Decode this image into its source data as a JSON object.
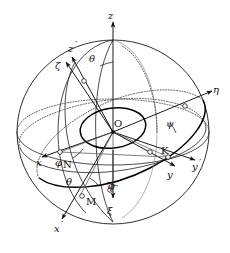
{
  "figure": {
    "background_color": "#ffffff",
    "stroke_color": "#1a1a1a",
    "width": 230,
    "height": 253
  },
  "axes": {
    "fixed": [
      {
        "id": "z",
        "label": "z",
        "primed": false,
        "description": "fixed vertical axis, arrow up"
      },
      {
        "id": "x",
        "label": "x",
        "primed": false,
        "description": "fixed axis toward lower-left"
      },
      {
        "id": "y",
        "label": "y",
        "primed": false,
        "description": "fixed axis toward lower-right"
      }
    ],
    "intermediate": [
      {
        "id": "zp",
        "label": "z",
        "prime": "′",
        "description": "intermediate axis toward upper-left"
      },
      {
        "id": "xp",
        "label": "x",
        "prime": "′",
        "description": "intermediate axis toward lower-left bottom"
      },
      {
        "id": "yp",
        "label": "y",
        "prime": "′",
        "description": "intermediate axis toward right"
      }
    ],
    "body": [
      {
        "id": "zeta",
        "label": "ζ",
        "description": "body axis zeta, upper-left"
      },
      {
        "id": "xi",
        "label": "ξ",
        "description": "body axis xi, downward"
      },
      {
        "id": "eta",
        "label": "η",
        "description": "body axis eta, upper-right"
      }
    ]
  },
  "angles": [
    {
      "id": "theta-top",
      "label": "θ",
      "description": "nutation angle between z and zeta at top"
    },
    {
      "id": "theta-bottom",
      "label": "θ",
      "description": "nutation angle near node N at bottom"
    },
    {
      "id": "phi",
      "label": "φ",
      "description": "precession angle at node N"
    },
    {
      "id": "phi-bottom",
      "label": "ϕ",
      "description": "angle at bottom near M"
    },
    {
      "id": "psi",
      "label": "ψ",
      "description": "spin angle at right, near K"
    }
  ],
  "points": [
    {
      "id": "O",
      "label": "O",
      "description": "origin / sphere center"
    },
    {
      "id": "N",
      "label": "N",
      "description": "node point, lower left"
    },
    {
      "id": "K",
      "label": "K",
      "description": "node point, right"
    },
    {
      "id": "M",
      "label": "M",
      "description": "node point, bottom"
    }
  ],
  "labels": {
    "z": "z",
    "z_prime": "z",
    "x": "x",
    "x_prime": "x",
    "y": "y",
    "y_prime": "y",
    "prime_mark": "′",
    "zeta": "ζ",
    "xi": "ξ",
    "eta": "η",
    "theta_top": "θ",
    "theta_bottom": "θ",
    "phi_node": "φ",
    "phi_bottom": "ϕ",
    "psi": "ψ",
    "O": "O",
    "N": "N",
    "K": "K",
    "M": "M"
  }
}
